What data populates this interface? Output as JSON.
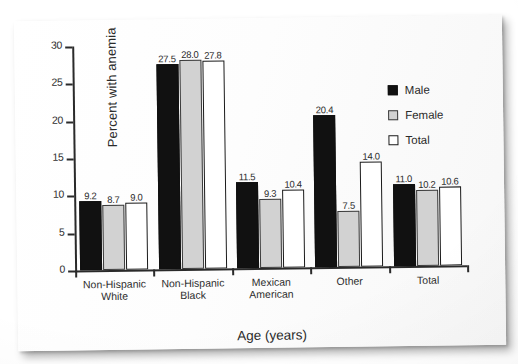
{
  "chart_data": {
    "type": "bar",
    "title": "",
    "xlabel": "Age (years)",
    "ylabel": "Percent with anemia",
    "ylim": [
      0,
      30
    ],
    "yticks": [
      0,
      5,
      10,
      15,
      20,
      25,
      30
    ],
    "ytick_labels": [
      "0",
      "5",
      "10",
      "15",
      "20",
      "25",
      "30"
    ],
    "grid": false,
    "legend_position": "upper right",
    "categories": [
      "Non-Hispanic White",
      "Non-Hispanic Black",
      "Mexican American",
      "Other",
      "Total"
    ],
    "category_lines": [
      [
        "Non-Hispanic",
        "White"
      ],
      [
        "Non-Hispanic",
        "Black"
      ],
      [
        "Mexican",
        "American"
      ],
      [
        "Other",
        ""
      ],
      [
        "Total",
        ""
      ]
    ],
    "series": [
      {
        "name": "Male",
        "color": "#111111",
        "values": [
          9.2,
          27.5,
          11.5,
          20.4,
          11.0
        ],
        "labels": [
          "9.2",
          "27.5",
          "11.5",
          "20.4",
          "11.0"
        ]
      },
      {
        "name": "Female",
        "color": "#d2d2d2",
        "values": [
          8.7,
          28.0,
          9.3,
          7.5,
          10.2
        ],
        "labels": [
          "8.7",
          "28.0",
          "9.3",
          "7.5",
          "10.2"
        ]
      },
      {
        "name": "Total",
        "color": "#ffffff",
        "values": [
          9.0,
          27.8,
          10.4,
          14.0,
          10.6
        ],
        "labels": [
          "9.0",
          "27.8",
          "10.4",
          "14.0",
          "10.6"
        ]
      }
    ]
  },
  "legend": {
    "items": [
      {
        "label": "Male"
      },
      {
        "label": "Female"
      },
      {
        "label": "Total"
      }
    ]
  },
  "axes": {
    "y_title": "Percent with anemia",
    "x_title": "Age (years)"
  }
}
